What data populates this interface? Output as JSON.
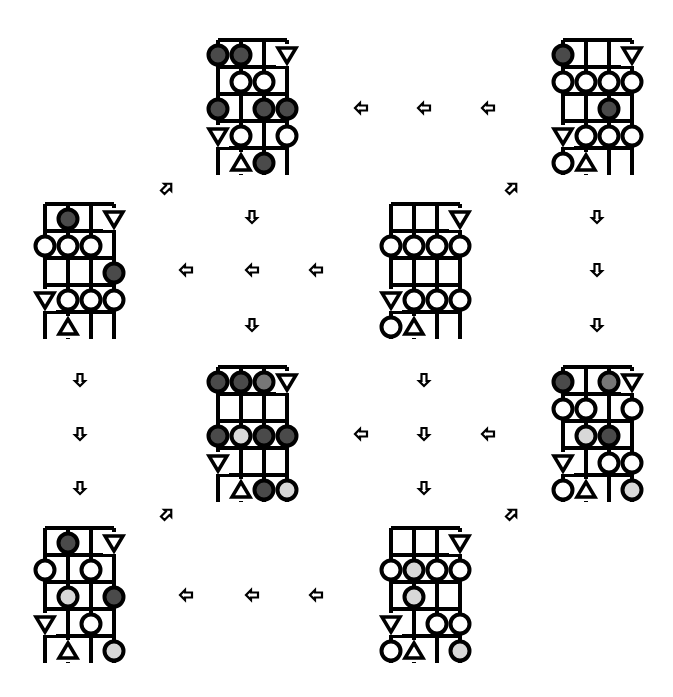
{
  "colors": {
    "line": "#000000",
    "dark": "#4a4a4a",
    "medium": "#777777",
    "light": "#d8d8d8",
    "white": "#ffffff"
  },
  "legend": {
    "D": "dark-circle",
    "M": "medium-circle",
    "L": "light-circle",
    "W": "white-circle",
    "V": "triangle-down",
    "A": "triangle-up",
    ".": "empty"
  },
  "panels": [
    {
      "id": "panel-1",
      "x": 218,
      "y": 55,
      "rows": [
        "DD.V",
        ".WW.",
        "D.DD",
        "VW.W",
        ".AD."
      ]
    },
    {
      "id": "panel-2",
      "x": 563,
      "y": 55,
      "rows": [
        "D..V",
        "WWWW",
        "..D.",
        "VWWW",
        "WA.."
      ]
    },
    {
      "id": "panel-3",
      "x": 45,
      "y": 219,
      "rows": [
        ".D.V",
        "WWW.",
        "...D",
        "VWWW",
        ".A.."
      ]
    },
    {
      "id": "panel-4",
      "x": 391,
      "y": 219,
      "rows": [
        "...V",
        "WWWW",
        "....",
        "VWWW",
        "WA.."
      ]
    },
    {
      "id": "panel-5",
      "x": 218,
      "y": 382,
      "rows": [
        "DDMV",
        "....",
        "DLDD",
        "V...",
        ".ADL"
      ]
    },
    {
      "id": "panel-6",
      "x": 563,
      "y": 382,
      "rows": [
        "D.MV",
        "WW.W",
        ".LD.",
        "V.WW",
        "WA.L"
      ]
    },
    {
      "id": "panel-7",
      "x": 45,
      "y": 543,
      "rows": [
        ".D.V",
        "W.W.",
        ".L.D",
        "V.W.",
        ".A.L"
      ]
    },
    {
      "id": "panel-8",
      "x": 391,
      "y": 543,
      "rows": [
        "...V",
        "WLWW",
        ".L..",
        "V.WW",
        "WA.L"
      ]
    }
  ],
  "arrows": [
    {
      "dir": "left",
      "x": 361,
      "y": 108
    },
    {
      "dir": "left",
      "x": 424,
      "y": 108
    },
    {
      "dir": "left",
      "x": 488,
      "y": 108
    },
    {
      "dir": "left",
      "x": 186,
      "y": 270
    },
    {
      "dir": "left",
      "x": 252,
      "y": 270
    },
    {
      "dir": "left",
      "x": 316,
      "y": 270
    },
    {
      "dir": "left",
      "x": 361,
      "y": 434
    },
    {
      "dir": "left",
      "x": 488,
      "y": 434
    },
    {
      "dir": "left",
      "x": 186,
      "y": 595
    },
    {
      "dir": "left",
      "x": 252,
      "y": 595
    },
    {
      "dir": "left",
      "x": 316,
      "y": 595
    },
    {
      "dir": "down",
      "x": 252,
      "y": 217
    },
    {
      "dir": "down",
      "x": 252,
      "y": 325
    },
    {
      "dir": "down",
      "x": 597,
      "y": 217
    },
    {
      "dir": "down",
      "x": 597,
      "y": 270
    },
    {
      "dir": "down",
      "x": 597,
      "y": 325
    },
    {
      "dir": "down",
      "x": 80,
      "y": 380
    },
    {
      "dir": "down",
      "x": 80,
      "y": 434
    },
    {
      "dir": "down",
      "x": 80,
      "y": 488
    },
    {
      "dir": "down",
      "x": 424,
      "y": 380
    },
    {
      "dir": "down",
      "x": 424,
      "y": 434
    },
    {
      "dir": "down",
      "x": 424,
      "y": 488
    },
    {
      "dir": "up-right",
      "x": 167,
      "y": 188
    },
    {
      "dir": "up-right",
      "x": 512,
      "y": 188
    },
    {
      "dir": "up-right",
      "x": 167,
      "y": 514
    },
    {
      "dir": "up-right",
      "x": 512,
      "y": 514
    }
  ],
  "grid": {
    "col_step": 23,
    "row_step": 27,
    "cols": 4,
    "rows": 5
  }
}
